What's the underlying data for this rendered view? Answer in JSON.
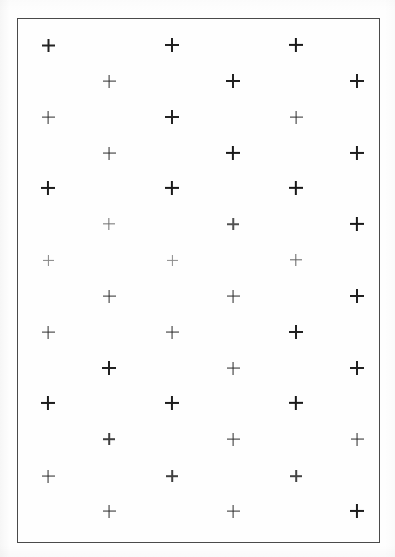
{
  "figure": {
    "background_color": "#ffffff",
    "paper_color": "#fefefe",
    "mark_color": "#111111",
    "frame_color": "#4a4a4a",
    "width": 395,
    "height": 557
  },
  "frame": {
    "label": "plot-border",
    "x": 17,
    "y": 18,
    "width": 363,
    "height": 525,
    "border_width": 1.5
  },
  "chart_data": {
    "type": "scatter",
    "subtitle": "",
    "xlabel": "",
    "ylabel": "",
    "marker": "plus",
    "grid": false,
    "legend": null,
    "axis_visible": false,
    "xlim": [
      17,
      380
    ],
    "ylim": [
      18,
      543
    ],
    "n_points": 42,
    "n_columns": 6,
    "n_rows": 7,
    "column_x": [
      48,
      109,
      172,
      233,
      296,
      357
    ],
    "row_y_odd_columns": [
      45,
      117,
      188,
      260,
      332,
      403,
      476
    ],
    "row_y_even_columns": [
      81,
      153,
      224,
      296,
      368,
      439,
      511
    ],
    "column_spacing": 62,
    "row_spacing": 72,
    "stagger_offset_y": 36,
    "points": [
      {
        "x": 48,
        "y": 45,
        "size": 13,
        "weight": 2.0,
        "opacity": 0.92
      },
      {
        "x": 48,
        "y": 117,
        "size": 13,
        "weight": 1.8,
        "opacity": 0.88
      },
      {
        "x": 48,
        "y": 188,
        "size": 14,
        "weight": 2.1,
        "opacity": 0.95
      },
      {
        "x": 48,
        "y": 260,
        "size": 11,
        "weight": 1.2,
        "opacity": 0.5
      },
      {
        "x": 48,
        "y": 332,
        "size": 13,
        "weight": 1.8,
        "opacity": 0.88
      },
      {
        "x": 48,
        "y": 403,
        "size": 14,
        "weight": 2.1,
        "opacity": 0.95
      },
      {
        "x": 48,
        "y": 476,
        "size": 13,
        "weight": 1.9,
        "opacity": 0.9
      },
      {
        "x": 109,
        "y": 81,
        "size": 13,
        "weight": 1.8,
        "opacity": 0.88
      },
      {
        "x": 109,
        "y": 153,
        "size": 13,
        "weight": 1.9,
        "opacity": 0.9
      },
      {
        "x": 109,
        "y": 224,
        "size": 12,
        "weight": 1.3,
        "opacity": 0.6
      },
      {
        "x": 109,
        "y": 296,
        "size": 13,
        "weight": 1.8,
        "opacity": 0.88
      },
      {
        "x": 109,
        "y": 368,
        "size": 14,
        "weight": 2.0,
        "opacity": 0.93
      },
      {
        "x": 109,
        "y": 439,
        "size": 12,
        "weight": 1.6,
        "opacity": 0.8
      },
      {
        "x": 109,
        "y": 511,
        "size": 13,
        "weight": 1.9,
        "opacity": 0.9
      },
      {
        "x": 172,
        "y": 45,
        "size": 14,
        "weight": 2.0,
        "opacity": 0.93
      },
      {
        "x": 172,
        "y": 117,
        "size": 14,
        "weight": 2.0,
        "opacity": 0.92
      },
      {
        "x": 172,
        "y": 188,
        "size": 14,
        "weight": 2.2,
        "opacity": 0.96
      },
      {
        "x": 172,
        "y": 260,
        "size": 11,
        "weight": 1.2,
        "opacity": 0.48
      },
      {
        "x": 172,
        "y": 332,
        "size": 13,
        "weight": 1.9,
        "opacity": 0.9
      },
      {
        "x": 172,
        "y": 403,
        "size": 14,
        "weight": 2.1,
        "opacity": 0.94
      },
      {
        "x": 172,
        "y": 476,
        "size": 12,
        "weight": 1.6,
        "opacity": 0.8
      },
      {
        "x": 233,
        "y": 81,
        "size": 14,
        "weight": 2.0,
        "opacity": 0.93
      },
      {
        "x": 233,
        "y": 153,
        "size": 14,
        "weight": 2.2,
        "opacity": 0.96
      },
      {
        "x": 233,
        "y": 224,
        "size": 12,
        "weight": 1.5,
        "opacity": 0.72
      },
      {
        "x": 233,
        "y": 296,
        "size": 13,
        "weight": 1.9,
        "opacity": 0.9
      },
      {
        "x": 233,
        "y": 368,
        "size": 13,
        "weight": 1.9,
        "opacity": 0.9
      },
      {
        "x": 233,
        "y": 439,
        "size": 13,
        "weight": 1.8,
        "opacity": 0.88
      },
      {
        "x": 233,
        "y": 511,
        "size": 13,
        "weight": 1.8,
        "opacity": 0.88
      },
      {
        "x": 296,
        "y": 45,
        "size": 14,
        "weight": 2.2,
        "opacity": 0.96
      },
      {
        "x": 296,
        "y": 117,
        "size": 13,
        "weight": 1.8,
        "opacity": 0.88
      },
      {
        "x": 296,
        "y": 188,
        "size": 14,
        "weight": 2.3,
        "opacity": 0.97
      },
      {
        "x": 296,
        "y": 260,
        "size": 12,
        "weight": 1.4,
        "opacity": 0.65
      },
      {
        "x": 296,
        "y": 332,
        "size": 14,
        "weight": 2.0,
        "opacity": 0.93
      },
      {
        "x": 296,
        "y": 403,
        "size": 14,
        "weight": 2.3,
        "opacity": 0.97
      },
      {
        "x": 296,
        "y": 476,
        "size": 12,
        "weight": 1.6,
        "opacity": 0.78
      },
      {
        "x": 357,
        "y": 81,
        "size": 14,
        "weight": 2.0,
        "opacity": 0.93
      },
      {
        "x": 357,
        "y": 153,
        "size": 14,
        "weight": 2.1,
        "opacity": 0.94
      },
      {
        "x": 357,
        "y": 224,
        "size": 14,
        "weight": 2.2,
        "opacity": 0.96
      },
      {
        "x": 357,
        "y": 296,
        "size": 14,
        "weight": 2.0,
        "opacity": 0.93
      },
      {
        "x": 357,
        "y": 368,
        "size": 14,
        "weight": 2.0,
        "opacity": 0.93
      },
      {
        "x": 357,
        "y": 439,
        "size": 13,
        "weight": 1.9,
        "opacity": 0.9
      },
      {
        "x": 357,
        "y": 511,
        "size": 14,
        "weight": 2.1,
        "opacity": 0.94
      }
    ]
  }
}
